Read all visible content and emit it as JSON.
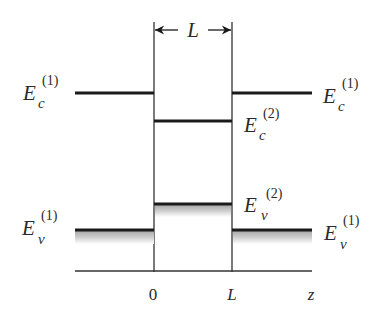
{
  "diagram": {
    "type": "energy-band-diagram",
    "width_label": "L",
    "levels": {
      "ec_left": {
        "symbol": "E",
        "sub": "c",
        "sup": "(1)"
      },
      "ec_right": {
        "symbol": "E",
        "sub": "c",
        "sup": "(1)"
      },
      "ec_well": {
        "symbol": "E",
        "sub": "c",
        "sup": "(2)"
      },
      "ev_well": {
        "symbol": "E",
        "sub": "v",
        "sup": "(2)"
      },
      "ev_left": {
        "symbol": "E",
        "sub": "v",
        "sup": "(1)"
      },
      "ev_right": {
        "symbol": "E",
        "sub": "v",
        "sup": "(1)"
      }
    },
    "axis": {
      "ticks": [
        "0",
        "L"
      ],
      "label": "z"
    },
    "colors": {
      "line": "#1a1a1a",
      "thin_line": "#333333",
      "shade": "#bdbdbd",
      "text": "#2a2a2a"
    }
  }
}
